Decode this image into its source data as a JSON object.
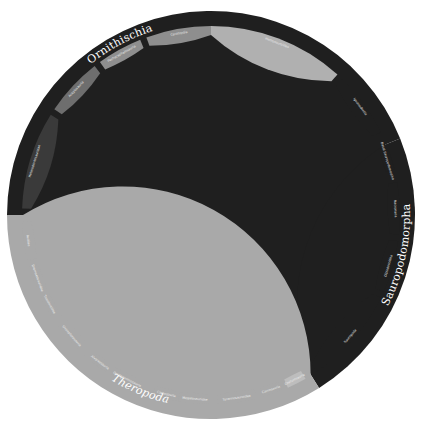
{
  "figure": {
    "type": "circular-phylogenetic-tree",
    "center": [
      211,
      215
    ],
    "colors": {
      "background": "#ffffff",
      "ornithischia_band": "#1f1f1f",
      "sauropodomorpha_band": "#1f1f1f",
      "theropoda_band": "#a9a9a9",
      "subclade_dark": "#3a3a3a",
      "subclade_mid": "#8e8e8e",
      "subclade_light": "#bdbdbd",
      "branch_lines": "#8a8a8a",
      "tip_lines": "#b9b9b9"
    }
  },
  "clades": [
    {
      "name": "Ornithischia",
      "start_deg": -180,
      "end_deg": -22,
      "color": "#1f1f1f",
      "label_deg": -118
    },
    {
      "name": "Sauropodomorpha",
      "start_deg": -22,
      "end_deg": 58,
      "color": "#1f1f1f",
      "label_deg": 12
    },
    {
      "name": "Theropoda",
      "start_deg": 58,
      "end_deg": 180,
      "color": "#a9a9a9",
      "label_deg": 112
    }
  ],
  "subclades": [
    {
      "name": "Heterodontosauridae",
      "start_deg": -178,
      "end_deg": -148,
      "color": "#3a3a3a"
    },
    {
      "name": "Ankylosauria",
      "start_deg": -146,
      "end_deg": -128,
      "color": "#6e6e6e"
    },
    {
      "name": "Pachycephalosauria",
      "start_deg": -126,
      "end_deg": -112,
      "color": "#8e8e8e"
    },
    {
      "name": "Ceratopsia",
      "start_deg": -110,
      "end_deg": -90,
      "color": "#8e8e8e"
    },
    {
      "name": "Hadrosauroidea",
      "start_deg": -90,
      "end_deg": -48,
      "color": "#b0b0b0"
    },
    {
      "name": "Iguanodontia",
      "start_deg": -46,
      "end_deg": -26,
      "color": "#1f1f1f"
    },
    {
      "name": "Basal Sauropodomorpha",
      "start_deg": -20,
      "end_deg": -14,
      "color": "#1f1f1f"
    },
    {
      "name": "Macronaria",
      "start_deg": -10,
      "end_deg": 6,
      "color": "#1f1f1f"
    },
    {
      "name": "Diplodocoidea",
      "start_deg": 8,
      "end_deg": 24,
      "color": "#1f1f1f"
    },
    {
      "name": "Sauropoda",
      "start_deg": 26,
      "end_deg": 56,
      "color": "#1f1f1f"
    },
    {
      "name": "Coelurosauria",
      "start_deg": 60,
      "end_deg": 66,
      "color": "#bdbdbd"
    },
    {
      "name": "Carnosauria",
      "start_deg": 68,
      "end_deg": 74,
      "color": "#a9a9a9"
    },
    {
      "name": "Tyrannosauroidea",
      "start_deg": 76,
      "end_deg": 88,
      "color": "#a9a9a9"
    },
    {
      "name": "Megalosauridae",
      "start_deg": 90,
      "end_deg": 100,
      "color": "#a9a9a9"
    },
    {
      "name": "Carnosauria",
      "start_deg": 100,
      "end_deg": 108,
      "color": "#a9a9a9"
    },
    {
      "name": "Ornithomimosauria",
      "start_deg": 112,
      "end_deg": 122,
      "color": "#a9a9a9"
    },
    {
      "name": "Alvarezsauria",
      "start_deg": 124,
      "end_deg": 130,
      "color": "#a9a9a9"
    },
    {
      "name": "Oviraptorosauria",
      "start_deg": 132,
      "end_deg": 146,
      "color": "#a9a9a9"
    },
    {
      "name": "Troodontidae",
      "start_deg": 148,
      "end_deg": 154,
      "color": "#a9a9a9"
    },
    {
      "name": "Dromaeosauridae",
      "start_deg": 156,
      "end_deg": 164,
      "color": "#a9a9a9"
    },
    {
      "name": "Avialae",
      "start_deg": 166,
      "end_deg": 178,
      "color": "#a9a9a9"
    }
  ],
  "labels": {
    "ornithischia": "Ornithischia",
    "sauropodomorpha": "Sauropodomorpha",
    "theropoda": "Theropoda"
  },
  "tree": {
    "tip_count": 420,
    "inner_circle_radius": 112,
    "tip_radius_min": 118,
    "tip_radius_max": 168,
    "root_radius": 14
  }
}
